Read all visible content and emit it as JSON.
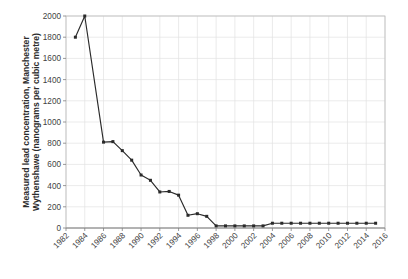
{
  "chart_data": {
    "type": "line",
    "title": "",
    "subtitle": "",
    "xlabel": "",
    "ylabel": "Measured lead concentration, Manchester Wythenshawe (nanograms per cubic metre)",
    "ylabel_line1": "Measured lead concentration, Manchester",
    "ylabel_line2": "Wythenshawe (nanograms per cubic metre)",
    "xlim": [
      1982,
      2016
    ],
    "ylim": [
      0,
      2000
    ],
    "ytick_step": 200,
    "xtick_step": 2,
    "grid": true,
    "legend": false,
    "legend_position": "none",
    "marker": "square",
    "line_color": "#2a2a2a",
    "grid_color": "#e2e2e2",
    "x_tick_labels": [
      "1982",
      "1984",
      "1986",
      "1988",
      "1990",
      "1992",
      "1994",
      "1996",
      "1998",
      "2000",
      "2002",
      "2004",
      "2006",
      "2008",
      "2010",
      "2012",
      "2014",
      "2016"
    ],
    "y_tick_labels": [
      "0",
      "200",
      "400",
      "600",
      "800",
      "1000",
      "1200",
      "1400",
      "1600",
      "1800",
      "2000"
    ],
    "series": [
      {
        "name": "Measured lead concentration",
        "x": [
          1983,
          1984,
          1986,
          1987,
          1988,
          1989,
          1990,
          1991,
          1992,
          1993,
          1994,
          1995,
          1996,
          1997,
          1998,
          1999,
          2000,
          2001,
          2002,
          2003,
          2004,
          2005,
          2006,
          2007,
          2008,
          2009,
          2010,
          2011,
          2012,
          2013,
          2014,
          2015
        ],
        "values": [
          1800,
          2000,
          810,
          815,
          730,
          640,
          500,
          450,
          340,
          345,
          310,
          120,
          135,
          110,
          20,
          20,
          20,
          20,
          20,
          20,
          45,
          45,
          45,
          45,
          45,
          45,
          45,
          45,
          45,
          45,
          45,
          45
        ]
      }
    ]
  }
}
